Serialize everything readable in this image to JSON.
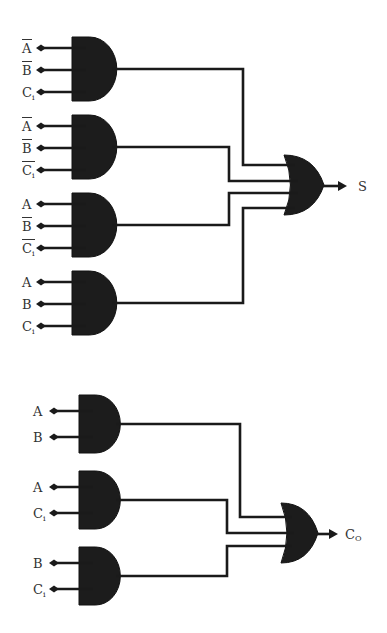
{
  "diagram": {
    "colors": {
      "gate": "#1c1c1c",
      "wire": "#1a1a1a",
      "label": "#333333",
      "background": "#ffffff"
    },
    "sum_circuit": {
      "output_label": "S",
      "output_gate": "OR",
      "and_gates": [
        {
          "inputs": [
            {
              "name": "A",
              "sub": "",
              "bar": true
            },
            {
              "name": "B",
              "sub": "",
              "bar": true
            },
            {
              "name": "C",
              "sub": "i",
              "bar": false
            }
          ]
        },
        {
          "inputs": [
            {
              "name": "A",
              "sub": "",
              "bar": true
            },
            {
              "name": "B",
              "sub": "",
              "bar": true
            },
            {
              "name": "C",
              "sub": "i",
              "bar": true
            }
          ]
        },
        {
          "inputs": [
            {
              "name": "A",
              "sub": "",
              "bar": false
            },
            {
              "name": "B",
              "sub": "",
              "bar": true
            },
            {
              "name": "C",
              "sub": "i",
              "bar": true
            }
          ]
        },
        {
          "inputs": [
            {
              "name": "A",
              "sub": "",
              "bar": false
            },
            {
              "name": "B",
              "sub": "",
              "bar": false
            },
            {
              "name": "C",
              "sub": "i",
              "bar": false
            }
          ]
        }
      ]
    },
    "carry_circuit": {
      "output_label": "C",
      "output_sub": "O",
      "output_gate": "OR",
      "and_gates": [
        {
          "inputs": [
            {
              "name": "A",
              "sub": "",
              "bar": false
            },
            {
              "name": "B",
              "sub": "",
              "bar": false
            }
          ]
        },
        {
          "inputs": [
            {
              "name": "A",
              "sub": "",
              "bar": false
            },
            {
              "name": "C",
              "sub": "i",
              "bar": false
            }
          ]
        },
        {
          "inputs": [
            {
              "name": "B",
              "sub": "",
              "bar": false
            },
            {
              "name": "C",
              "sub": "i",
              "bar": false
            }
          ]
        }
      ]
    }
  }
}
